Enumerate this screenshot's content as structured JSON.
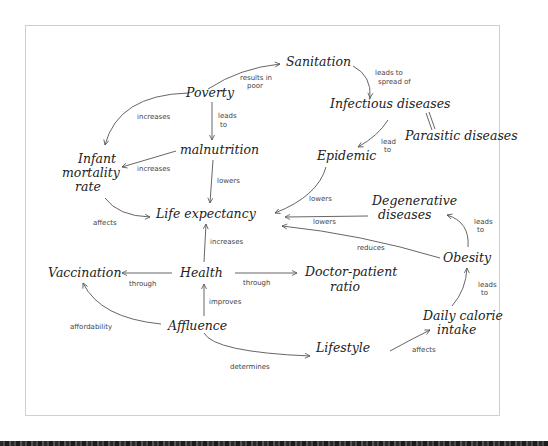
{
  "diagram": {
    "type": "concept-map",
    "nodes": {
      "sanitation": "Sanitation",
      "poverty": "Poverty",
      "infectious": "Infectious diseases",
      "parasitic": "Parasitic diseases",
      "malnutrition": "malnutrition",
      "epidemic": "Epidemic",
      "infant_l1": "Infant",
      "infant_l2": "mortality",
      "infant_l3": "rate",
      "life": "Life expectancy",
      "degenerative_l1": "Degenerative",
      "degenerative_l2": "diseases",
      "obesity": "Obesity",
      "vaccination": "Vaccination",
      "health": "Health",
      "doctor_l1": "Doctor-patient",
      "doctor_l2": "ratio",
      "affluence": "Affluence",
      "lifestyle": "Lifestyle",
      "calorie_l1": "Daily calorie",
      "calorie_l2": "intake"
    },
    "edges": {
      "poverty_sanitation_l1": "results in",
      "poverty_sanitation_l2": "poor",
      "sanitation_infectious_l1": "leads to",
      "sanitation_infectious_l2": "spread of",
      "poverty_infant": "increases",
      "poverty_malnutrition_l1": "leads",
      "poverty_malnutrition_l2": "to",
      "infectious_epidemic_l1": "lead",
      "infectious_epidemic_l2": "to",
      "malnutrition_infant": "increases",
      "malnutrition_life": "lowers",
      "epidemic_life": "lowers",
      "infant_life": "affects",
      "degenerative_life": "lowers",
      "obesity_degenerative_l1": "leads",
      "obesity_degenerative_l2": "to",
      "obesity_life": "reduces",
      "health_life": "increases",
      "health_vaccination": "through",
      "health_doctor": "through",
      "affluence_health": "improves",
      "affluence_vaccination": "affordability",
      "calorie_obesity_l1": "leads",
      "calorie_obesity_l2": "to",
      "affluence_lifestyle": "determines",
      "lifestyle_calorie": "affects"
    },
    "relations": [
      {
        "from": "Poverty",
        "to": "Sanitation",
        "label": "results in poor"
      },
      {
        "from": "Sanitation",
        "to": "Infectious diseases",
        "label": "leads to spread of"
      },
      {
        "from": "Infectious diseases",
        "to": "Parasitic diseases",
        "label": ""
      },
      {
        "from": "Poverty",
        "to": "Infant mortality rate",
        "label": "increases"
      },
      {
        "from": "Poverty",
        "to": "malnutrition",
        "label": "leads to"
      },
      {
        "from": "Infectious diseases",
        "to": "Epidemic",
        "label": "lead to"
      },
      {
        "from": "malnutrition",
        "to": "Infant mortality rate",
        "label": "increases"
      },
      {
        "from": "malnutrition",
        "to": "Life expectancy",
        "label": "lowers"
      },
      {
        "from": "Epidemic",
        "to": "Life expectancy",
        "label": "lowers"
      },
      {
        "from": "Infant mortality rate",
        "to": "Life expectancy",
        "label": "affects"
      },
      {
        "from": "Degenerative diseases",
        "to": "Life expectancy",
        "label": "lowers"
      },
      {
        "from": "Obesity",
        "to": "Degenerative diseases",
        "label": "leads to"
      },
      {
        "from": "Obesity",
        "to": "Life expectancy",
        "label": "reduces"
      },
      {
        "from": "Health",
        "to": "Life expectancy",
        "label": "increases"
      },
      {
        "from": "Health",
        "to": "Vaccination",
        "label": "through"
      },
      {
        "from": "Health",
        "to": "Doctor-patient ratio",
        "label": "through"
      },
      {
        "from": "Affluence",
        "to": "Health",
        "label": "improves"
      },
      {
        "from": "Affluence",
        "to": "Vaccination",
        "label": "affordability"
      },
      {
        "from": "Daily calorie intake",
        "to": "Obesity",
        "label": "leads to"
      },
      {
        "from": "Affluence",
        "to": "Lifestyle",
        "label": "determines"
      },
      {
        "from": "Lifestyle",
        "to": "Daily calorie intake",
        "label": "affects"
      }
    ]
  }
}
